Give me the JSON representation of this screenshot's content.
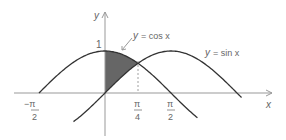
{
  "chart_data": {
    "type": "line",
    "title": "",
    "xlabel": "x",
    "ylabel": "y",
    "series": [
      {
        "name": "y = cos x",
        "function": "cos(x)",
        "domain": [
          -1.5708,
          2.2
        ]
      },
      {
        "name": "y = sin x",
        "function": "sin(x)",
        "domain": [
          -0.75,
          3.25
        ]
      }
    ],
    "shaded_region": {
      "between": [
        "cos x",
        "sin x"
      ],
      "x_from": 0,
      "x_to": 0.7854,
      "color": "#666666"
    },
    "x_ticks": [
      "-π/2",
      "π/4",
      "π/2"
    ],
    "y_ticks": [
      "1"
    ],
    "annotations": [
      "y = cos x",
      "y = sin x"
    ],
    "dashed_line_at": "π/4"
  },
  "labels": {
    "y_axis": "y",
    "x_axis": "x",
    "one": "1",
    "cos_label_y": "y",
    "cos_label_rest": "= cos x",
    "sin_label_y": "y",
    "sin_label_rest": "= sin x",
    "neg_pi": "−π",
    "two": "2",
    "pi": "π",
    "four": "4"
  }
}
